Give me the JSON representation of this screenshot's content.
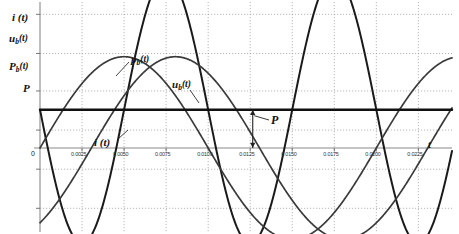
{
  "chart_data": {
    "type": "line",
    "title": "",
    "xlabel": "t",
    "ylabel": "",
    "axis_labels": [
      {
        "key": "i",
        "text": "i (t)"
      },
      {
        "key": "ub",
        "text": "u b(t)"
      },
      {
        "key": "pb",
        "text": "P b(t)"
      },
      {
        "key": "P",
        "text": "P"
      }
    ],
    "xticks": [
      "0.0025",
      "0.0050",
      "0.0075",
      "0.0100",
      "0.0125",
      "0.0150",
      "0.0175",
      "0.0200",
      "0.0225"
    ],
    "xtick_values": [
      0.0025,
      0.005,
      0.0075,
      0.01,
      0.0125,
      0.015,
      0.0175,
      0.02,
      0.0225
    ],
    "origin_label": "0",
    "xlim": [
      0,
      0.0245
    ],
    "ylim": [
      -1.35,
      1.25
    ],
    "grid": true,
    "grid_style": "dotted",
    "legend": "inline-annotations",
    "annotations": [
      {
        "key": "pb_curve",
        "text": "p b(t)",
        "x": 0.00675,
        "y": 0.72
      },
      {
        "key": "ub_curve",
        "text": "u b(t)",
        "x": 0.00985,
        "y": 0.47
      },
      {
        "key": "i_curve",
        "text": "i (t)",
        "x": 0.00435,
        "y": 0.07
      },
      {
        "key": "P_arrow",
        "text": "P",
        "x": 0.01395,
        "y": 0.235
      }
    ],
    "series": [
      {
        "name": "p b(t)",
        "role": "instantaneous-power",
        "waveform": "raised-cosine",
        "amplitude": 0.82,
        "offset": 0.235,
        "period": 0.01,
        "phase_deg": 180,
        "color": "#1a1a1a",
        "line_width": 2.0
      },
      {
        "name": "u b(t)",
        "role": "voltage",
        "waveform": "sine",
        "amplitude": 0.56,
        "offset": 0,
        "period": 0.02,
        "phase_deg": 0,
        "color": "#3a3a3a",
        "line_width": 1.7
      },
      {
        "name": "i (t)",
        "role": "current",
        "waveform": "sine",
        "amplitude": 0.56,
        "offset": 0,
        "period": 0.02,
        "phase_deg": -55,
        "color": "#3a3a3a",
        "line_width": 1.7
      },
      {
        "name": "P",
        "role": "average-power",
        "waveform": "constant",
        "value": 0.235,
        "color": "#111111",
        "line_width": 2.4
      }
    ],
    "measurement_arrow": {
      "label": "P",
      "from_y": 0,
      "to_y": 0.235,
      "at_x": 0.01265,
      "double_headed": true
    }
  }
}
